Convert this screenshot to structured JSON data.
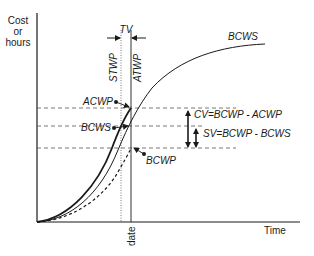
{
  "diagram": {
    "axes": {
      "y_label_lines": [
        "Cost",
        "or",
        "hours"
      ],
      "x_label": "Time",
      "date_label": "date"
    },
    "time_variance": {
      "label": "TV",
      "stwp_label": "STWP",
      "atwp_label": "ATWP"
    },
    "curves": {
      "bcws_top_label": "BCWS",
      "acwp_label": "ACWP",
      "bcws_label": "BCWS",
      "bcwp_label": "BCWP"
    },
    "variances": {
      "cv_label": "CV=BCWP - ACWP",
      "sv_label": "SV=BCWP - BCWS"
    },
    "colors": {
      "line": "#1a1a1a",
      "dashed": "#555555",
      "background": "#ffffff"
    }
  }
}
